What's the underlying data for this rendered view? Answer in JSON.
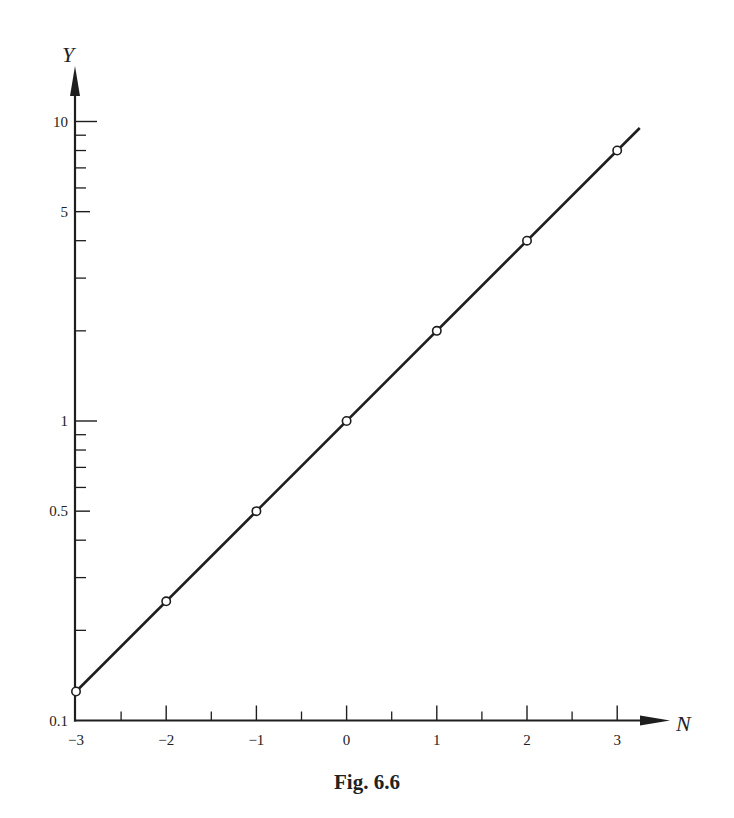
{
  "caption": "Fig. 6.6",
  "colors": {
    "ink": "#1e1e1e",
    "background": "#ffffff"
  },
  "chart_data": {
    "type": "line",
    "title": "Fig. 6.6",
    "xlabel": "N",
    "ylabel": "Y",
    "y_scale": "log",
    "xlim": [
      -3,
      3.25
    ],
    "ylim": [
      0.1,
      12
    ],
    "grid": false,
    "legend": null,
    "x_ticks": [
      -3,
      -2,
      -1,
      0,
      1,
      2,
      3
    ],
    "x_tick_labels": [
      "−3",
      "−2",
      "−1",
      "0",
      "1",
      "2",
      "3"
    ],
    "x_minor_ticks": [
      -2.5,
      -1.5,
      -0.5,
      0.5,
      1.5,
      2.5
    ],
    "y_ticks": [
      0.1,
      0.5,
      1,
      5,
      10
    ],
    "y_tick_labels": [
      "0.1",
      "0.5",
      "1",
      "5",
      "10"
    ],
    "y_minor_ticks": [
      0.2,
      0.3,
      0.4,
      0.6,
      0.7,
      0.8,
      0.9,
      2,
      3,
      4,
      6,
      7,
      8,
      9
    ],
    "series": [
      {
        "name": "Y = 2^N",
        "marker": "open-circle",
        "x": [
          -3,
          -2,
          -1,
          0,
          1,
          2,
          3
        ],
        "y": [
          0.125,
          0.25,
          0.5,
          1,
          2,
          4,
          8
        ]
      }
    ],
    "fit_line": {
      "x_range": [
        -3,
        3.25
      ],
      "equation": "Y = 2^N"
    }
  }
}
